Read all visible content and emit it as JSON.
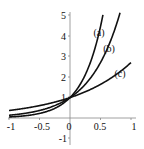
{
  "chart_data": {
    "type": "line",
    "title": "",
    "xlabel": "",
    "ylabel": "",
    "xlim": [
      -1,
      1
    ],
    "ylim": [
      -1,
      5
    ],
    "grid": false,
    "x_ticks": [
      "-1",
      "-0.5",
      "0",
      "0.5",
      "1"
    ],
    "y_ticks": [
      "5",
      "4",
      "3",
      "2",
      "1",
      "-1"
    ],
    "series": [
      {
        "name": "(a)",
        "function": "e^(3x)",
        "x": [
          -1,
          -0.5,
          0,
          0.25,
          0.5,
          0.54
        ],
        "values": [
          0.05,
          0.22,
          1.0,
          2.12,
          4.48,
          5.0
        ]
      },
      {
        "name": "(b)",
        "function": "e^(2x)",
        "x": [
          -1,
          -0.5,
          0,
          0.25,
          0.5,
          0.8
        ],
        "values": [
          0.14,
          0.37,
          1.0,
          1.65,
          2.72,
          4.95
        ]
      },
      {
        "name": "(c)",
        "function": "e^x",
        "x": [
          -1,
          -0.5,
          0,
          0.5,
          1
        ],
        "values": [
          0.37,
          0.61,
          1.0,
          1.65,
          2.72
        ]
      }
    ],
    "annotations": [
      {
        "text": "(a)",
        "x": 0.47,
        "y": 4.1
      },
      {
        "text": "(b)",
        "x": 0.64,
        "y": 3.3
      },
      {
        "text": "(c)",
        "x": 0.82,
        "y": 2.1
      }
    ]
  },
  "labels": {
    "a": "(a)",
    "b": "(b)",
    "c": "(c)",
    "xt_m1": "-1",
    "xt_m05": "-0.5",
    "xt_0": "0",
    "xt_05": "0.5",
    "xt_1": "1",
    "yt_5": "5",
    "yt_4": "4",
    "yt_3": "3",
    "yt_2": "2",
    "yt_1": "1",
    "yt_m1": "-1"
  }
}
